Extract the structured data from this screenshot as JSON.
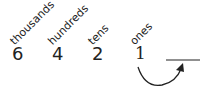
{
  "place_values": [
    {
      "label": "thousands",
      "digit": "6"
    },
    {
      "label": "hundreds",
      "digit": "4"
    },
    {
      "label": "tens",
      "digit": "2"
    },
    {
      "label": "ones",
      "digit": "1"
    }
  ],
  "blank": "",
  "arrow": {
    "from": "ones",
    "to": "blank"
  },
  "colors": {
    "ink": "#222222",
    "background": "#ffffff"
  }
}
